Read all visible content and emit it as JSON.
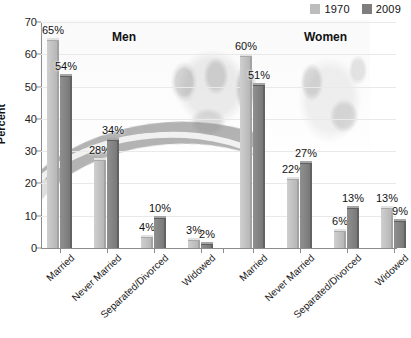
{
  "chart_data": {
    "type": "bar",
    "title": "",
    "xlabel": "",
    "ylabel": "Percent",
    "ylim": [
      0,
      70
    ],
    "ytick_values": [
      0,
      10,
      20,
      30,
      40,
      50,
      60,
      70
    ],
    "ytick_labels": [
      "0",
      "10",
      "20",
      "30",
      "40",
      "50",
      "60",
      "70"
    ],
    "grid": true,
    "legend_position": "top-right",
    "panels": [
      {
        "name": "Men",
        "categories": [
          "Married",
          "Never Married",
          "Separated/Divorced",
          "Widowed"
        ],
        "series": [
          {
            "name": "1970",
            "values": [
              65,
              28,
              4,
              3
            ],
            "labels": [
              "65%",
              "28%",
              "4%",
              "3%"
            ]
          },
          {
            "name": "2009",
            "values": [
              54,
              34,
              10,
              2
            ],
            "labels": [
              "54%",
              "34%",
              "10%",
              "2%"
            ]
          }
        ]
      },
      {
        "name": "Women",
        "categories": [
          "Married",
          "Never Married",
          "Separated/Divorced",
          "Widowed"
        ],
        "series": [
          {
            "name": "1970",
            "values": [
              60,
              22,
              6,
              13
            ],
            "labels": [
              "60%",
              "22%",
              "6%",
              "13%"
            ]
          },
          {
            "name": "2009",
            "values": [
              51,
              27,
              13,
              9
            ],
            "labels": [
              "51%",
              "27%",
              "13%",
              "9%"
            ]
          }
        ]
      }
    ]
  },
  "legend": {
    "items": [
      {
        "label": "1970",
        "color": "#bdbdbd"
      },
      {
        "label": "2009",
        "color": "#7e7e7e"
      }
    ]
  },
  "axes": {
    "y_title": "Percent",
    "y_ticks": [
      "70",
      "60",
      "50",
      "40",
      "30",
      "20",
      "10",
      "0"
    ]
  },
  "headings": {
    "men": "Men",
    "women": "Women"
  },
  "x_labels": {
    "men": [
      "Married",
      "Never Married",
      "Separated/Divorced",
      "Widowed"
    ],
    "women": [
      "Married",
      "Never Married",
      "Separated/Divorced",
      "Widowed"
    ]
  },
  "bar_labels": {
    "men_1970": [
      "65%",
      "28%",
      "4%",
      "3%"
    ],
    "men_2009": [
      "54%",
      "34%",
      "10%",
      "2%"
    ],
    "women_1970": [
      "60%",
      "22%",
      "6%",
      "13%"
    ],
    "women_2009": [
      "51%",
      "27%",
      "13%",
      "9%"
    ]
  },
  "caption": ""
}
